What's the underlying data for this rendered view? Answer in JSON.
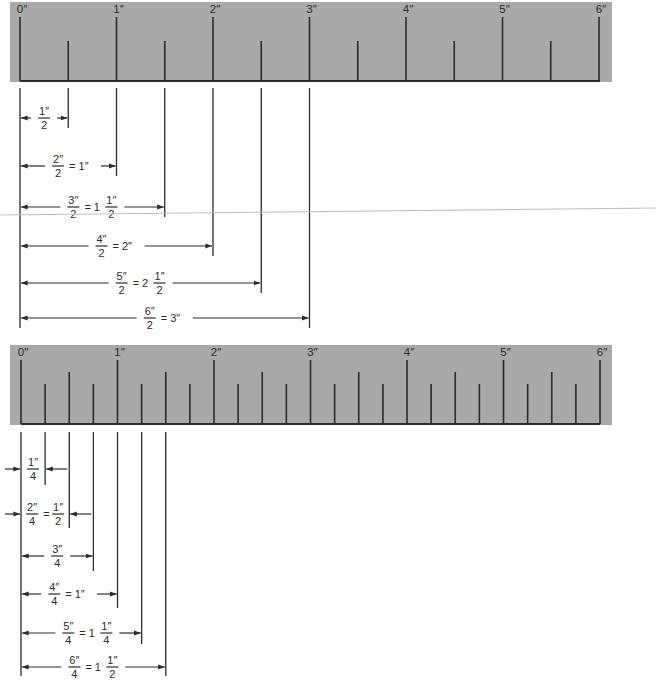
{
  "diagram": {
    "colors": {
      "ruler_face": "#a9a9a9",
      "ink": "#2b2b2b",
      "scan_artifact_line": "#bdbdbd"
    },
    "px_per_inch": 96.5,
    "ruler_top": {
      "inch_labels": [
        "0″",
        "1″",
        "2″",
        "3″",
        "4″",
        "5″",
        "6″"
      ],
      "subdivision": "halves",
      "dimensions": [
        {
          "numerator": "1″",
          "denominator": "2",
          "result_whole": "",
          "result_frac_num": "",
          "result_frac_den": "",
          "result_text": "",
          "length_in": 0.5
        },
        {
          "numerator": "2″",
          "denominator": "2",
          "result_text": "= 1″",
          "length_in": 1.0
        },
        {
          "numerator": "3″",
          "denominator": "2",
          "result_whole": "= 1",
          "result_frac_num": "1″",
          "result_frac_den": "2",
          "length_in": 1.5
        },
        {
          "numerator": "4″",
          "denominator": "2",
          "result_text": "= 2″",
          "length_in": 2.0
        },
        {
          "numerator": "5″",
          "denominator": "2",
          "result_whole": "= 2",
          "result_frac_num": "1″",
          "result_frac_den": "2",
          "length_in": 2.5
        },
        {
          "numerator": "6″",
          "denominator": "2",
          "result_text": "= 3″",
          "length_in": 3.0
        }
      ]
    },
    "ruler_bottom": {
      "inch_labels": [
        "0″",
        "1″",
        "2″",
        "3″",
        "4″",
        "5″",
        "6″"
      ],
      "subdivision": "quarters",
      "dimensions": [
        {
          "numerator": "1″",
          "denominator": "4",
          "length_in": 0.25
        },
        {
          "numerator": "2″",
          "denominator": "4",
          "result_whole": "=",
          "result_frac_num": "1″",
          "result_frac_den": "2",
          "length_in": 0.5
        },
        {
          "numerator": "3″",
          "denominator": "4",
          "length_in": 0.75
        },
        {
          "numerator": "4″",
          "denominator": "4",
          "result_text": "= 1″",
          "length_in": 1.0
        },
        {
          "numerator": "5″",
          "denominator": "4",
          "result_whole": "= 1",
          "result_frac_num": "1″",
          "result_frac_den": "4",
          "length_in": 1.25
        },
        {
          "numerator": "6″",
          "denominator": "4",
          "result_whole": "= 1",
          "result_frac_num": "1″",
          "result_frac_den": "2",
          "length_in": 1.5
        }
      ]
    }
  }
}
